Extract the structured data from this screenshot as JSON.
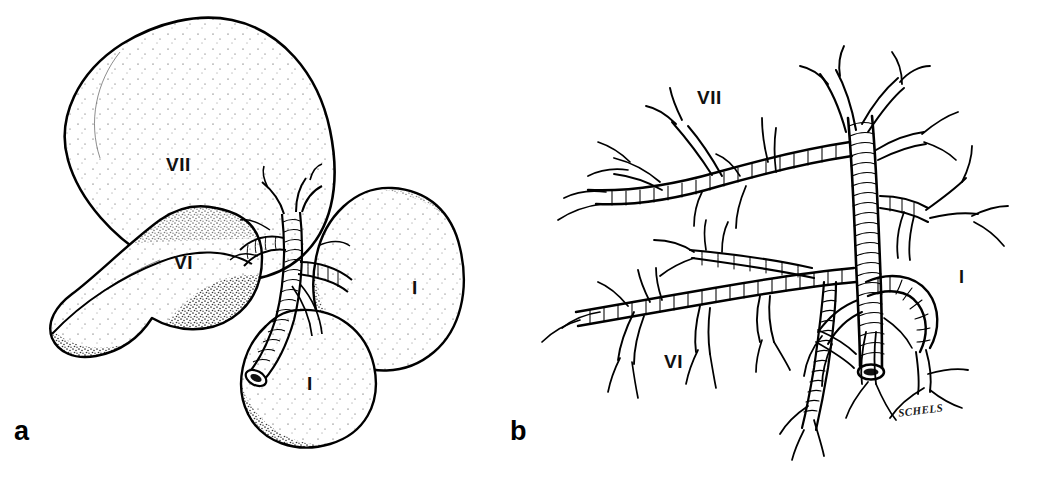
{
  "figure": {
    "type": "two-panel anatomical line illustration",
    "style": "pen-and-ink stipple drawing",
    "background_color": "#ffffff",
    "ink_color": "#000000",
    "width": 1037,
    "height": 479
  },
  "panels": [
    {
      "id": "a",
      "letter": "a",
      "caption_letter": "a",
      "content": "Bronchopulmonary segment bodies with stippled shading and central bronchovascular bundle",
      "labels": [
        {
          "text": "VII",
          "x": 166,
          "y": 155,
          "segment": "superior segment VII"
        },
        {
          "text": "VI",
          "x": 174,
          "y": 253,
          "segment": "segment VI"
        },
        {
          "text": "I",
          "x": 412,
          "y": 278,
          "segment": "segment I lateral"
        },
        {
          "text": "I",
          "x": 307,
          "y": 374,
          "segment": "segment I inferior"
        }
      ]
    },
    {
      "id": "b",
      "letter": "b",
      "caption_letter": "b",
      "content": "Bronchial tree branching pattern for the same segments, drawn with cartilage ring hatching",
      "labels": [
        {
          "text": "VII",
          "x": 697,
          "y": 98,
          "segment": "segment VII bronchus"
        },
        {
          "text": "VI",
          "x": 664,
          "y": 362,
          "segment": "segment VI bronchus"
        },
        {
          "text": "I",
          "x": 959,
          "y": 278,
          "segment": "segment I bronchus"
        }
      ],
      "signature": {
        "text": "SCHELS",
        "x": 898,
        "y": 412
      }
    }
  ],
  "colors": {
    "ink": "#000000",
    "background": "#ffffff",
    "stipple": "#1a1a1a",
    "label": "#111111"
  }
}
